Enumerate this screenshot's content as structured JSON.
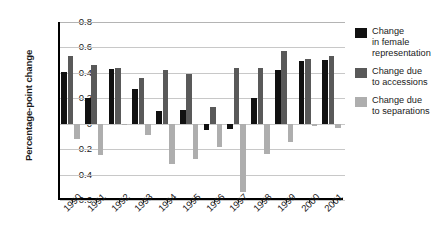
{
  "chart_data": {
    "type": "bar",
    "title": "",
    "xlabel": "",
    "ylabel": "Percentage-point change",
    "ylim": [
      -0.6,
      0.8
    ],
    "ytick_labels": [
      "0.8",
      "0.6",
      "0.4",
      "0.2",
      "0",
      "-0.2",
      "-0.4",
      "-0.6"
    ],
    "ytick_values": [
      0.8,
      0.6,
      0.4,
      0.2,
      0,
      -0.2,
      -0.4,
      -0.6
    ],
    "grid": true,
    "legend_position": "right",
    "categories": [
      "1990",
      "1991",
      "1992",
      "1993",
      "1994",
      "1995",
      "1996",
      "1997",
      "1998",
      "1999",
      "2000",
      "2001"
    ],
    "series": [
      {
        "name": "Change in female representation",
        "color": "#111111",
        "values": [
          0.41,
          0.2,
          0.43,
          0.27,
          0.1,
          0.11,
          -0.05,
          -0.04,
          0.2,
          0.42,
          0.49,
          0.5
        ]
      },
      {
        "name": "Change due to accessions",
        "color": "#595959",
        "values": [
          0.53,
          0.46,
          0.44,
          0.36,
          0.42,
          0.39,
          0.13,
          0.44,
          0.44,
          0.57,
          0.51,
          0.53
        ]
      },
      {
        "name": "Change due to separations",
        "color": "#aeaeae",
        "values": [
          -0.12,
          -0.25,
          -0.01,
          -0.09,
          -0.32,
          -0.28,
          -0.18,
          -0.54,
          -0.24,
          -0.14,
          -0.02,
          -0.03
        ]
      }
    ]
  },
  "legend": {
    "items": [
      {
        "label_line1": "Change",
        "label_line2": "in female",
        "label_line3": "representation",
        "swatch": "black-swatch"
      },
      {
        "label_line1": "Change due",
        "label_line2": "to accessions",
        "label_line3": "",
        "swatch": "dark-gray-swatch"
      },
      {
        "label_line1": "Change due",
        "label_line2": "to separations",
        "label_line3": "",
        "swatch": "light-gray-swatch"
      }
    ]
  }
}
